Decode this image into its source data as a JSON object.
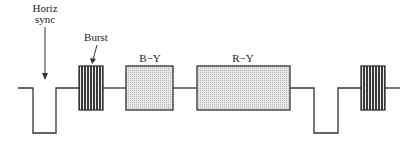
{
  "diagram": {
    "type": "composite-video-signal-line",
    "labels": {
      "horiz_sync_line1": "Horiz",
      "horiz_sync_line2": "sync",
      "burst": "Burst",
      "b_minus_y": "B−Y",
      "r_minus_y": "R−Y"
    },
    "colors": {
      "line": "#333333",
      "burst_fill": "#555555",
      "chroma_fill": "#d8d8d8"
    }
  }
}
